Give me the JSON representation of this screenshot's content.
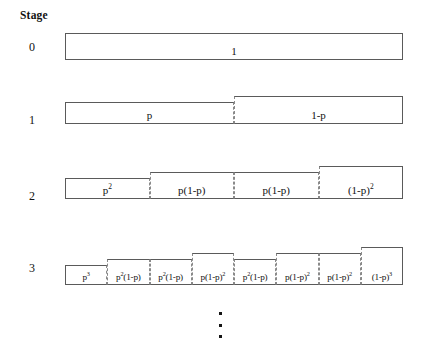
{
  "diagram": {
    "title": "Stage",
    "geometry": {
      "left": 65,
      "right": 403,
      "baselines": [
        60,
        124,
        199,
        285
      ],
      "step": 6
    },
    "rows": [
      {
        "label": "0",
        "label_y": 40,
        "baseline": 60,
        "box_height": 27,
        "cells": [
          {
            "text": "1",
            "html": "1",
            "step": 0
          }
        ]
      },
      {
        "label": "1",
        "label_y": 113,
        "baseline": 124,
        "box_height": 22,
        "cells": [
          {
            "text": "p",
            "html": "p",
            "step": 0
          },
          {
            "text": "1-p",
            "html": "1-p",
            "step": 1
          }
        ]
      },
      {
        "label": "2",
        "label_y": 189,
        "baseline": 199,
        "box_height": 21,
        "cells": [
          {
            "text": "p^2",
            "html": "p<sup>2</sup>",
            "step": 0
          },
          {
            "text": "p(1-p)",
            "html": "p(1-p)",
            "step": 1
          },
          {
            "text": "p(1-p)",
            "html": "p(1-p)",
            "step": 1
          },
          {
            "text": "(1-p)^2",
            "html": "(1-p)<sup>2</sup>",
            "step": 2
          }
        ]
      },
      {
        "label": "3",
        "label_y": 261,
        "baseline": 285,
        "box_height": 20,
        "cells": [
          {
            "text": "p^3",
            "html": "p<sup>3</sup>",
            "step": 0,
            "tiny": true
          },
          {
            "text": "p^2(1-p)",
            "html": "p<sup>2</sup>(1-p)",
            "step": 1,
            "tiny": true
          },
          {
            "text": "p^2(1-p)",
            "html": "p<sup>2</sup>(1-p)",
            "step": 1,
            "tiny": true
          },
          {
            "text": "p(1-p)^2",
            "html": "p(1-p)<sup>2</sup>",
            "step": 2,
            "tiny": true
          },
          {
            "text": "p^2(1-p)",
            "html": "p<sup>2</sup>(1-p)",
            "step": 1,
            "tiny": true
          },
          {
            "text": "p(1-p)^2",
            "html": "p(1-p)<sup>2</sup>",
            "step": 2,
            "tiny": true
          },
          {
            "text": "p(1-p)^2",
            "html": "p(1-p)<sup>2</sup>",
            "step": 2,
            "tiny": true
          },
          {
            "text": "(1-p)^3",
            "html": "(1-p)<sup>3</sup>",
            "step": 3,
            "tiny": true
          }
        ]
      }
    ],
    "continuation": {
      "name": "vertical-ellipsis",
      "glyph": "⋮",
      "dot_count": 3,
      "x": 221,
      "y": 312,
      "height": 26
    },
    "colors": {
      "solid_border": "#5a5a5a",
      "dashed_border": "#8a8a8a",
      "text": "#111111",
      "background": "#ffffff"
    }
  }
}
